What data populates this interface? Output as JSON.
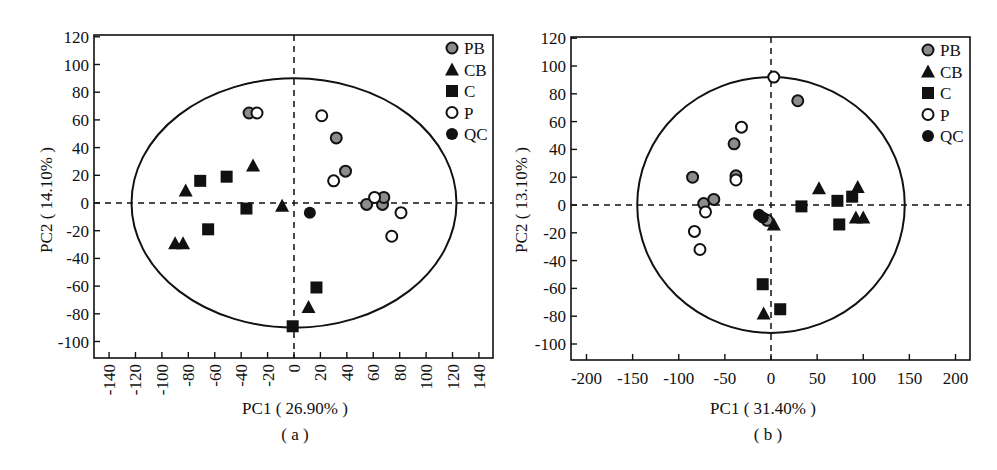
{
  "chart_data": [
    {
      "type": "scatter",
      "panel_label": "( a )",
      "xlabel": "PC1 ( 26.90% )",
      "ylabel": "PC2 ( 14.10% )",
      "xlim": [
        -150,
        150
      ],
      "ylim": [
        -112,
        120
      ],
      "xticks": [
        -140,
        -120,
        -100,
        -80,
        -60,
        -40,
        -20,
        0,
        20,
        40,
        60,
        80,
        100,
        120,
        140
      ],
      "yticks": [
        120,
        100,
        80,
        60,
        40,
        20,
        0,
        -20,
        -40,
        -60,
        -80,
        -100
      ],
      "grid": false,
      "reference_lines": {
        "x": 0,
        "y": 0,
        "style": "dashed"
      },
      "ellipse": {
        "cx": 0,
        "cy": 0,
        "rx": 123,
        "ry": 90
      },
      "legend_position": "top-right",
      "legend": [
        "PB",
        "CB",
        "C",
        "P",
        "QC"
      ],
      "series": [
        {
          "name": "PB",
          "marker": "circle-gray",
          "points": [
            [
              -34,
              65
            ],
            [
              32,
              47
            ],
            [
              39,
              23
            ],
            [
              55,
              -1
            ],
            [
              67,
              -1
            ],
            [
              68,
              4
            ]
          ]
        },
        {
          "name": "CB",
          "marker": "triangle-black",
          "points": [
            [
              -82,
              9
            ],
            [
              -31,
              27
            ],
            [
              -90,
              -29
            ],
            [
              -84,
              -29
            ],
            [
              -9,
              -2
            ],
            [
              11,
              -75
            ]
          ]
        },
        {
          "name": "C",
          "marker": "square-black",
          "points": [
            [
              -71,
              16
            ],
            [
              -51,
              19
            ],
            [
              -36,
              -4
            ],
            [
              -65,
              -19
            ],
            [
              17,
              -61
            ],
            [
              -1,
              -89
            ]
          ]
        },
        {
          "name": "P",
          "marker": "circle-open",
          "points": [
            [
              -28,
              65
            ],
            [
              21,
              63
            ],
            [
              30,
              16
            ],
            [
              61,
              4
            ],
            [
              81,
              -7
            ],
            [
              74,
              -24
            ]
          ]
        },
        {
          "name": "QC",
          "marker": "circle-black",
          "points": [
            [
              12,
              -7
            ]
          ]
        }
      ]
    },
    {
      "type": "scatter",
      "panel_label": "( b )",
      "xlabel": "PC1 ( 31.40% )",
      "ylabel": "PC2 ( 13.10% )",
      "xlim": [
        -218,
        218
      ],
      "ylim": [
        -112,
        120
      ],
      "xticks": [
        -200,
        -150,
        -100,
        -50,
        0,
        50,
        100,
        150,
        200
      ],
      "yticks": [
        120,
        100,
        80,
        60,
        40,
        20,
        0,
        -20,
        -40,
        -60,
        -80,
        -100
      ],
      "grid": false,
      "reference_lines": {
        "x": 0,
        "y": 0,
        "style": "dashed"
      },
      "ellipse": {
        "cx": 0,
        "cy": 0,
        "rx": 145,
        "ry": 92
      },
      "legend_position": "top-right",
      "legend": [
        "PB",
        "CB",
        "C",
        "P",
        "QC"
      ],
      "series": [
        {
          "name": "PB",
          "marker": "circle-gray",
          "points": [
            [
              29,
              75
            ],
            [
              -40,
              44
            ],
            [
              -85,
              20
            ],
            [
              -38,
              21
            ],
            [
              -73,
              1
            ],
            [
              -62,
              4
            ],
            [
              -4,
              -11
            ]
          ]
        },
        {
          "name": "CB",
          "marker": "triangle-black",
          "points": [
            [
              52,
              12
            ],
            [
              94,
              13
            ],
            [
              92,
              -9
            ],
            [
              100,
              -9
            ],
            [
              3,
              -14
            ],
            [
              -8,
              -78
            ]
          ]
        },
        {
          "name": "C",
          "marker": "square-black",
          "points": [
            [
              33,
              -1
            ],
            [
              72,
              3
            ],
            [
              88,
              6
            ],
            [
              74,
              -14
            ],
            [
              -9,
              -57
            ],
            [
              10,
              -75
            ]
          ]
        },
        {
          "name": "P",
          "marker": "circle-open",
          "points": [
            [
              3,
              92
            ],
            [
              -32,
              56
            ],
            [
              -38,
              18
            ],
            [
              -71,
              -5
            ],
            [
              -83,
              -19
            ],
            [
              -77,
              -32
            ]
          ]
        },
        {
          "name": "QC",
          "marker": "circle-black",
          "points": [
            [
              -13,
              -7
            ],
            [
              -9,
              -9
            ]
          ]
        }
      ]
    }
  ]
}
